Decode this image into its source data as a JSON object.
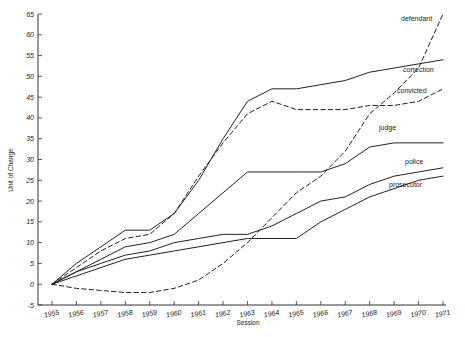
{
  "chart_data": {
    "type": "line",
    "title": "",
    "xlabel": "Session",
    "ylabel": "Unit of Change",
    "x": [
      1955,
      1956,
      1957,
      1958,
      1959,
      1960,
      1961,
      1962,
      1963,
      1964,
      1965,
      1966,
      1967,
      1968,
      1969,
      1970,
      1971
    ],
    "xtick_labels": [
      "1955",
      "1956",
      "1957",
      "1958",
      "1959",
      "1960",
      "1961",
      "1962",
      "1963",
      "1964",
      "1965",
      "1966",
      "1967",
      "1968",
      "1969",
      "1970",
      "1971"
    ],
    "ytick_labels": [
      "-5",
      "0",
      "5",
      "10",
      "15",
      "20",
      "25",
      "30",
      "35",
      "40",
      "45",
      "50",
      "55",
      "60",
      "65"
    ],
    "ylim": [
      -5,
      65
    ],
    "xlim": [
      1955,
      1971
    ],
    "ytick_step": 5,
    "grid": false,
    "legend": "inline-right-labels",
    "series": [
      {
        "name": "defendant",
        "style": "dashed",
        "label": "defendant",
        "values": [
          0,
          -1,
          -1.5,
          -2,
          -2,
          -1,
          1,
          5,
          10,
          16,
          22,
          26,
          32,
          41,
          46,
          52,
          65
        ]
      },
      {
        "name": "correction",
        "style": "solid",
        "label": "correction",
        "values": [
          0,
          5,
          9,
          13,
          13,
          17,
          25,
          35,
          44,
          47,
          47,
          48,
          49,
          51,
          52,
          53,
          54
        ]
      },
      {
        "name": "convicted",
        "style": "dashed",
        "label": "convicted",
        "values": [
          0,
          4,
          8,
          11,
          12,
          17,
          26,
          34,
          41,
          44,
          42,
          42,
          42,
          43,
          43,
          44,
          47
        ]
      },
      {
        "name": "judge",
        "style": "solid",
        "label": "judge",
        "values": [
          0,
          3,
          6,
          9,
          10,
          12,
          17,
          22,
          27,
          27,
          27,
          27,
          29,
          33,
          34,
          34,
          34
        ]
      },
      {
        "name": "police",
        "style": "solid",
        "label": "police",
        "values": [
          0,
          3,
          5,
          7,
          8,
          10,
          11,
          12,
          12,
          14,
          17,
          20,
          21,
          24,
          26,
          27,
          28
        ]
      },
      {
        "name": "prosecutor",
        "style": "solid",
        "label": "prosecutor",
        "values": [
          0,
          2,
          4,
          6,
          7,
          8,
          9,
          10,
          11,
          11,
          11,
          15,
          18,
          21,
          23,
          25,
          26
        ]
      }
    ]
  },
  "axis": {
    "y_title": "Unit of Change",
    "x_title": "Session"
  }
}
